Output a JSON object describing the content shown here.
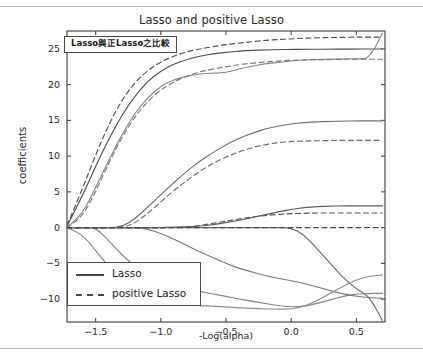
{
  "figure": {
    "title": "Lasso and positive Lasso",
    "annotation": "Lasso與正Lasso之比較",
    "background": "#ffffff",
    "border_color": "#b8b8b8"
  },
  "axes": {
    "xlabel": "-Log(alpha)",
    "ylabel": "coefficients",
    "xticks": [
      "-1.5",
      "-1.0",
      "-0.5",
      "0.0",
      "0.5"
    ],
    "xtick_values": [
      -1.5,
      -1.0,
      -0.5,
      0.0,
      0.5
    ],
    "yticks": [
      "25",
      "20",
      "15",
      "10",
      "5",
      "0",
      "-5",
      "-10"
    ],
    "ytick_values": [
      25,
      20,
      15,
      10,
      5,
      0,
      -5,
      -10
    ],
    "xlim": [
      -1.72,
      0.72
    ],
    "ylim": [
      -13.2,
      27.5
    ],
    "grid": false,
    "spine_color": "#3a3a3a"
  },
  "legend": {
    "position": "lower left",
    "entries": [
      {
        "label": "Lasso",
        "style": "solid",
        "color": "#4a4a4a"
      },
      {
        "label": "positive Lasso",
        "style": "dashed",
        "color": "#4a4a4a"
      }
    ]
  },
  "chart_data": {
    "type": "line",
    "title": "Lasso and positive Lasso",
    "xlabel": "-Log(alpha)",
    "ylabel": "coefficients",
    "xlim": [
      -1.72,
      0.72
    ],
    "ylim": [
      -13.2,
      27.5
    ],
    "grid": false,
    "legend_position": "lower left",
    "x": [
      -1.72,
      -1.6,
      -1.5,
      -1.4,
      -1.3,
      -1.2,
      -1.1,
      -1.0,
      -0.9,
      -0.8,
      -0.7,
      -0.6,
      -0.5,
      -0.4,
      -0.3,
      -0.2,
      -0.1,
      0.0,
      0.1,
      0.2,
      0.3,
      0.4,
      0.5,
      0.6,
      0.7
    ],
    "series": [
      {
        "name": "lasso-1",
        "style": "solid",
        "color": "#4f4f4f",
        "values": [
          0.2,
          4.5,
          8.6,
          12.4,
          15.7,
          18.4,
          20.5,
          21.9,
          22.9,
          23.5,
          24.0,
          24.3,
          24.5,
          24.7,
          24.8,
          24.85,
          24.9,
          24.92,
          24.94,
          24.95,
          24.96,
          24.97,
          24.97,
          24.98,
          24.98
        ]
      },
      {
        "name": "lasso-2",
        "style": "solid",
        "color": "#8a8a8a",
        "values": [
          0.0,
          2.0,
          5.6,
          9.4,
          13.0,
          16.0,
          18.2,
          19.8,
          20.7,
          21.2,
          21.5,
          21.6,
          21.7,
          22.2,
          22.6,
          22.9,
          23.1,
          23.3,
          23.45,
          23.5,
          23.55,
          23.6,
          23.6,
          23.6,
          27.2
        ]
      },
      {
        "name": "lasso-3",
        "style": "solid",
        "color": "#6e6e6e",
        "values": [
          0.0,
          0.0,
          0.0,
          0.0,
          0.1,
          1.2,
          2.9,
          4.6,
          6.3,
          7.9,
          9.3,
          10.5,
          11.6,
          12.5,
          13.2,
          13.8,
          14.2,
          14.5,
          14.7,
          14.8,
          14.85,
          14.9,
          14.92,
          14.93,
          14.93
        ]
      },
      {
        "name": "lasso-4",
        "style": "solid",
        "color": "#5a5a5a",
        "values": [
          0.0,
          0.0,
          0.0,
          0.0,
          0.0,
          0.0,
          0.0,
          0.0,
          0.05,
          0.1,
          0.2,
          0.4,
          0.7,
          1.0,
          1.4,
          1.8,
          2.2,
          2.55,
          2.8,
          2.95,
          3.0,
          3.05,
          3.05,
          3.05,
          3.05
        ]
      },
      {
        "name": "lasso-5",
        "style": "solid",
        "color": "#6a6a6a",
        "values": [
          0.0,
          0.0,
          0.0,
          0.0,
          0.0,
          0.0,
          0.0,
          0.0,
          0.0,
          0.0,
          0.0,
          0.0,
          0.0,
          0.0,
          0.0,
          0.0,
          0.0,
          0.0,
          -1.0,
          -3.0,
          -5.0,
          -7.0,
          -8.6,
          -9.6,
          -13.0
        ]
      },
      {
        "name": "lasso-6",
        "style": "solid",
        "color": "#7a7a7a",
        "values": [
          0.0,
          0.0,
          0.0,
          0.0,
          0.0,
          0.0,
          -0.2,
          -0.8,
          -1.6,
          -2.5,
          -3.4,
          -4.2,
          -5.0,
          -5.7,
          -6.2,
          -6.7,
          -7.1,
          -7.4,
          -7.8,
          -8.3,
          -8.8,
          -9.3,
          -9.6,
          -9.8,
          -9.9
        ]
      },
      {
        "name": "lasso-7",
        "style": "solid",
        "color": "#838383",
        "values": [
          0.0,
          0.0,
          0.0,
          -1.8,
          -3.8,
          -5.4,
          -6.5,
          -7.4,
          -8.0,
          -8.5,
          -8.9,
          -9.3,
          -9.6,
          -10.0,
          -10.3,
          -10.6,
          -10.9,
          -11.1,
          -11.0,
          -10.6,
          -10.1,
          -9.6,
          -9.3,
          -9.2,
          -9.2
        ]
      },
      {
        "name": "lasso-8",
        "style": "solid",
        "color": "#8d8d8d",
        "values": [
          0.0,
          -1.0,
          -3.2,
          -5.5,
          -7.3,
          -8.6,
          -9.4,
          -10.0,
          -10.4,
          -10.7,
          -10.9,
          -11.0,
          -11.1,
          -11.2,
          -11.3,
          -11.35,
          -11.4,
          -11.4,
          -11.0,
          -10.2,
          -9.2,
          -8.2,
          -7.3,
          -6.8,
          -6.6
        ]
      },
      {
        "name": "positive-lasso-1",
        "style": "dashed",
        "color": "#4f4f4f",
        "values": [
          0.3,
          5.5,
          10.2,
          14.4,
          17.8,
          20.3,
          22.0,
          23.2,
          24.0,
          24.6,
          25.0,
          25.3,
          25.6,
          25.8,
          26.0,
          26.2,
          26.3,
          26.4,
          26.5,
          26.55,
          26.6,
          26.6,
          26.65,
          26.65,
          26.65
        ]
      },
      {
        "name": "positive-lasso-2",
        "style": "dashed",
        "color": "#7a7a7a",
        "values": [
          0.0,
          1.6,
          5.0,
          9.0,
          12.6,
          15.5,
          17.7,
          19.3,
          20.4,
          21.2,
          21.8,
          22.2,
          22.5,
          22.8,
          23.0,
          23.15,
          23.3,
          23.4,
          23.45,
          23.5,
          23.5,
          23.55,
          23.55,
          23.55,
          23.55
        ]
      },
      {
        "name": "positive-lasso-3",
        "style": "dashed",
        "color": "#6e6e6e",
        "values": [
          0.0,
          0.0,
          0.0,
          0.0,
          0.0,
          0.6,
          2.0,
          3.6,
          5.2,
          6.6,
          7.9,
          9.0,
          9.9,
          10.6,
          11.2,
          11.6,
          11.9,
          12.05,
          12.1,
          12.15,
          12.18,
          12.2,
          12.2,
          12.2,
          12.2
        ]
      },
      {
        "name": "positive-lasso-4",
        "style": "dashed",
        "color": "#5a5a5a",
        "values": [
          0.0,
          0.0,
          0.0,
          0.0,
          0.0,
          0.0,
          0.0,
          0.0,
          0.0,
          0.1,
          0.3,
          0.6,
          0.9,
          1.2,
          1.5,
          1.7,
          1.85,
          1.95,
          2.0,
          2.05,
          2.05,
          2.05,
          2.05,
          2.05,
          2.05
        ]
      },
      {
        "name": "positive-lasso-zero",
        "style": "dashed",
        "color": "#4a4a4a",
        "values": [
          0.0,
          0.0,
          0.0,
          0.0,
          0.0,
          0.0,
          0.0,
          0.0,
          0.0,
          0.0,
          0.0,
          0.0,
          0.0,
          0.0,
          0.0,
          0.0,
          0.0,
          0.0,
          0.0,
          0.0,
          0.0,
          0.0,
          0.0,
          0.0,
          0.0
        ]
      }
    ]
  }
}
